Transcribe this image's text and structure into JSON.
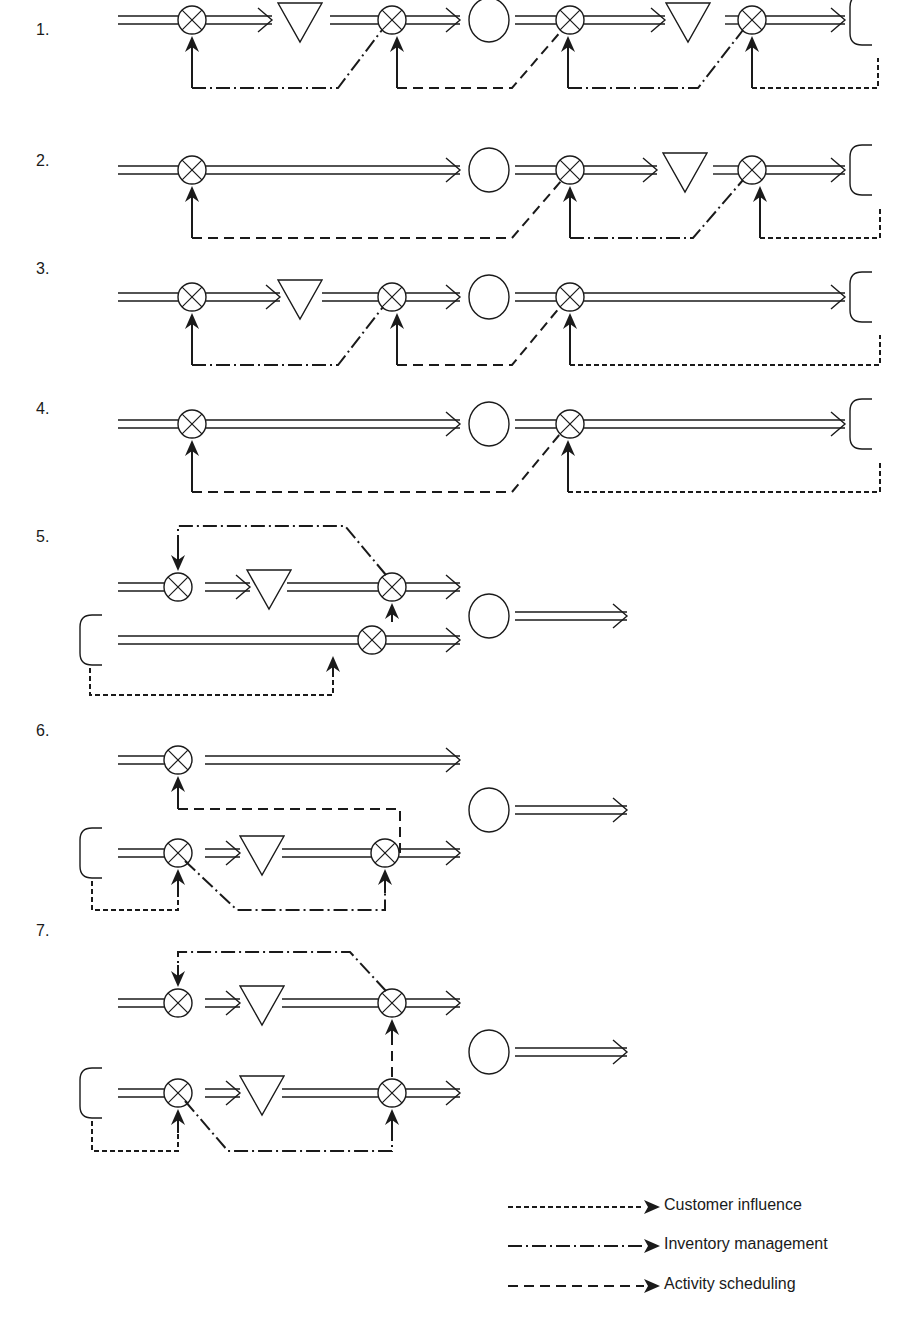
{
  "diagram": {
    "title": "",
    "stroke_color": "#1a1a1a",
    "background": "#ffffff",
    "symbols": {
      "mixer": "circle-with-x (control point)",
      "triangle": "inverted-triangle (inventory)",
      "circle": "circle (customer/activity)",
      "bracket": "open-bracket (source/sink)",
      "flow": "double-line-arrow (material flow)"
    },
    "rows": [
      {
        "label": "1.",
        "label_pos": [
          36,
          21
        ],
        "y": 20,
        "flows": [
          [
            118,
            178
          ],
          [
            205,
            272
          ],
          [
            330,
            378
          ],
          [
            405,
            460
          ],
          [
            515,
            556
          ],
          [
            583,
            665
          ],
          [
            725,
            739
          ],
          [
            766,
            845
          ]
        ],
        "arrowheads": [
          272,
          460,
          665,
          845
        ],
        "mixers": [
          192,
          392,
          570,
          752
        ],
        "triangles": [
          300,
          688
        ],
        "circles": [
          489
        ],
        "brackets": [
          [
            862,
            20
          ]
        ],
        "signals": [
          {
            "type": "inventory",
            "points": [
              [
                192,
                99
              ],
              [
                192,
                52
              ]
            ],
            "path": "M192,108 L340,108 L385,55"
          },
          {
            "type": "activity",
            "points": [
              [
                392,
                99
              ],
              [
                392,
                52
              ]
            ],
            "path": "M392,108 L510,108 L562,55"
          },
          {
            "type": "inventory",
            "points": [
              [
                568,
                99
              ],
              [
                568,
                52
              ]
            ],
            "path": "M568,108 L698,108 L745,55"
          },
          {
            "type": "customer",
            "points": [
              [
                752,
                99
              ],
              [
                752,
                52
              ]
            ],
            "path": "M752,108 L878,108 L878,85"
          }
        ]
      },
      {
        "label": "2.",
        "label_pos": [
          36,
          152
        ],
        "y": 170,
        "flows": [
          [
            118,
            178
          ],
          [
            205,
            460
          ],
          [
            515,
            556
          ],
          [
            583,
            657
          ],
          [
            713,
            739
          ],
          [
            766,
            845
          ]
        ],
        "arrowheads": [
          460,
          657,
          845
        ],
        "mixers": [
          192,
          570,
          752
        ],
        "triangles": [
          685
        ],
        "circles": [
          489
        ],
        "brackets": [
          [
            862,
            170
          ]
        ],
        "signals": [
          {
            "type": "activity",
            "path": "M192,235 L510,235 L562,203",
            "arrow_x": 192,
            "arrow_y": [
              235,
              200
            ]
          },
          {
            "type": "inventory",
            "path": "M570,235 L695,235 L745,203",
            "arrow_x": 570,
            "arrow_y": [
              235,
              200
            ]
          },
          {
            "type": "customer",
            "path": "M752,235 L880,235 L880,217",
            "arrow_x": 752,
            "arrow_y": [
              235,
              200
            ]
          }
        ]
      },
      {
        "label": "3.",
        "label_pos": [
          36,
          260
        ],
        "y": 297,
        "flows": [
          [
            118,
            178
          ],
          [
            205,
            280
          ],
          [
            322,
            378
          ],
          [
            405,
            460
          ],
          [
            515,
            556
          ],
          [
            583,
            845
          ]
        ],
        "arrowheads": [
          280,
          460,
          845
        ],
        "mixers": [
          192,
          392,
          570
        ],
        "triangles": [
          300
        ],
        "circles": [
          489
        ],
        "brackets": [
          [
            862,
            297
          ]
        ],
        "signals": [
          {
            "type": "inventory",
            "path": "M192,360 L338,360 L385,330",
            "arrow_x": 192,
            "arrow_y": [
              360,
              328
            ]
          },
          {
            "type": "activity",
            "path": "M395,360 L510,360 L560,330",
            "arrow_x": 395,
            "arrow_y": [
              360,
              328
            ]
          },
          {
            "type": "customer",
            "path": "M570,360 L880,360 L880,342",
            "arrow_x": 570,
            "arrow_y": [
              360,
              328
            ]
          }
        ]
      },
      {
        "label": "4.",
        "label_pos": [
          36,
          400
        ],
        "y": 424,
        "flows": [
          [
            118,
            178
          ],
          [
            205,
            460
          ],
          [
            515,
            556
          ],
          [
            583,
            845
          ]
        ],
        "arrowheads": [
          460,
          845
        ],
        "mixers": [
          192,
          570
        ],
        "triangles": [],
        "circles": [
          489
        ],
        "brackets": [
          [
            862,
            424
          ]
        ],
        "signals": [
          {
            "type": "activity",
            "path": "M192,487 L510,487 L560,455",
            "arrow_x": 192,
            "arrow_y": [
              487,
              455
            ]
          },
          {
            "type": "customer",
            "path": "M568,487 L880,487 L880,469",
            "arrow_x": 568,
            "arrow_y": [
              487,
              455
            ]
          }
        ]
      },
      {
        "label": "5.",
        "label_pos": [
          36,
          528
        ],
        "type": "parallel",
        "top_y": 587,
        "bottom_y": 640,
        "merge_circle": [
          489,
          616
        ],
        "out_flow": [
          515,
          627
        ],
        "top_line": {
          "flows": [
            [
              118,
              178
            ],
            [
              205,
              250
            ],
            [
              287,
              378
            ],
            [
              405,
              460
            ]
          ],
          "arrowheads": [
            250,
            460
          ],
          "mixers": [
            192,
            392
          ],
          "triangles": [
            269
          ]
        },
        "bottom_line": {
          "flows": [
            [
              118,
              358
            ],
            [
              385,
              460
            ]
          ],
          "arrowheads": [
            460
          ],
          "mixers": [
            372
          ]
        },
        "bracket": [
          92,
          640
        ],
        "signals": [
          {
            "type": "inventory",
            "path": "M395,575 L305,525 L178,525 L178,560",
            "arrow_down": [
              178,
              545,
              574
            ]
          },
          {
            "type": "scheduling",
            "path": "M398,612",
            "arrow_up": [
              398,
              630,
              603
            ]
          },
          {
            "type": "customer",
            "path": "M90,675 L332,675 L332,655",
            "arrow_up": [
              332,
              655,
              626
            ]
          }
        ]
      },
      {
        "label": "6.",
        "label_pos": [
          36,
          722
        ],
        "type": "parallel",
        "top_y": 760,
        "bottom_y": 853,
        "merge_circle": [
          489,
          810
        ],
        "out_flow": [
          515,
          627
        ],
        "top_line": {
          "flows": [
            [
              118,
              178
            ],
            [
              205,
              460
            ]
          ],
          "arrowheads": [
            460
          ],
          "mixers": [
            192
          ]
        },
        "bottom_line": {
          "flows": [
            [
              118,
              178
            ],
            [
              205,
              240
            ],
            [
              282,
              372
            ],
            [
              399,
              460
            ]
          ],
          "arrowheads": [
            240,
            460
          ],
          "mixers": [
            192,
            385
          ],
          "triangles": [
            262
          ]
        },
        "bracket": [
          92,
          853
        ],
        "signals": [
          {
            "type": "activity",
            "path": "M400,851 L400,809 L192,809 L192,790",
            "arrow_up": [
              192,
              805,
              780
            ]
          },
          {
            "type": "customer",
            "path": "M92,878 L92,910 L192,910 L192,880",
            "arrow_up": [
              192,
              895,
              870
            ]
          },
          {
            "type": "inventory",
            "path": "M192,865 L250,910 L385,910 L385,878",
            "arrow_up": [
              385,
              895,
              870
            ]
          }
        ]
      },
      {
        "label": "7.",
        "label_pos": [
          36,
          922
        ],
        "type": "parallel",
        "top_y": 1003,
        "bottom_y": 1093,
        "merge_circle": [
          489,
          1052
        ],
        "out_flow": [
          515,
          627
        ],
        "top_line": {
          "flows": [
            [
              118,
              178
            ],
            [
              205,
              240
            ],
            [
              282,
              378
            ],
            [
              405,
              460
            ]
          ],
          "arrowheads": [
            240,
            460
          ],
          "mixers": [
            192,
            392
          ],
          "triangles": [
            262
          ]
        },
        "bottom_line": {
          "flows": [
            [
              118,
              178
            ],
            [
              205,
              240
            ],
            [
              282,
              378
            ],
            [
              405,
              460
            ]
          ],
          "arrowheads": [
            240,
            460
          ],
          "mixers": [
            192,
            392
          ],
          "triangles": [
            262
          ]
        },
        "bracket": [
          92,
          1093
        ],
        "signals": [
          {
            "type": "inventory",
            "path": "M392,988 L305,952 L178,952 L178,982",
            "arrow_down": [
              178,
              968,
              988
            ]
          },
          {
            "type": "scheduling",
            "path": "M392,1078 L392,1030",
            "arrow_up": [
              392,
              1040,
              1018
            ]
          },
          {
            "type": "customer",
            "path": "M92,1118 L92,1152 L178,1152 L178,1122",
            "arrow_up": [
              178,
              1138,
              1108
            ]
          },
          {
            "type": "inventory",
            "path": "M185,1098 L228,1152 L392,1152 L392,1122",
            "arrow_up": [
              392,
              1138,
              1108
            ]
          }
        ]
      }
    ],
    "legend": {
      "items": [
        {
          "label": "Customer influence",
          "type": "customer",
          "y": 1207
        },
        {
          "label": "Inventory management",
          "type": "inventory",
          "y": 1246
        },
        {
          "label": "Activity scheduling",
          "type": "activity",
          "y": 1286
        }
      ],
      "line_x": [
        508,
        648
      ],
      "text_x": 664
    },
    "dash_styles": {
      "customer": "5 3",
      "inventory": "14 4 2 4",
      "activity": "10 6",
      "scheduling": "10 6"
    }
  }
}
